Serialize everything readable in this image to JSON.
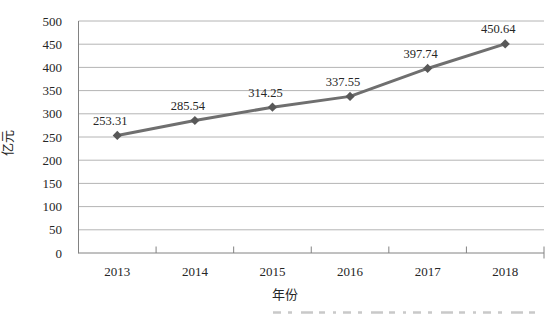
{
  "chart_data": {
    "type": "line",
    "title": "",
    "categories": [
      "2013",
      "2014",
      "2015",
      "2016",
      "2017",
      "2018"
    ],
    "series": [
      {
        "name": "",
        "values": [
          253.31,
          285.54,
          314.25,
          337.55,
          397.74,
          450.64
        ],
        "value_labels": [
          "253.31",
          "285.54",
          "314.25",
          "337.55",
          "397.74",
          "450.64"
        ],
        "marker": "diamond",
        "line_color": "#6f6f6f",
        "marker_color": "#585858"
      }
    ],
    "xlabel": "年份",
    "ylabel": "亿元",
    "ylim": [
      0,
      500
    ],
    "ytick_interval": 50,
    "yticks": [
      "0",
      "50",
      "100",
      "150",
      "200",
      "250",
      "300",
      "350",
      "400",
      "450",
      "500"
    ],
    "grid": "horizontal-major",
    "legend_position": "none"
  },
  "styles": {
    "background": "#ffffff",
    "gridline_color": "#b4b4b4",
    "axis_color": "#828282",
    "label_color": "#262626",
    "artifact_color": "#c9c9c9"
  }
}
